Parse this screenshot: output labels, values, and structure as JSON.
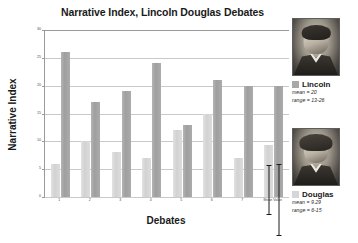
{
  "chart_data": {
    "type": "bar",
    "title": "Narrative Index, Lincoln Douglas Debates",
    "xlabel": "Debates",
    "ylabel": "Narrative Index",
    "ylim": [
      0,
      30
    ],
    "yticks": [
      0,
      5,
      10,
      15,
      20,
      25,
      30
    ],
    "ytick_labels": [
      "0",
      "5",
      "10",
      "15",
      "20",
      "25",
      "30"
    ],
    "grid": true,
    "legend_position": "right",
    "categories": [
      "1",
      "2",
      "3",
      "4",
      "5",
      "6",
      "7",
      "Mean Value"
    ],
    "series": [
      {
        "name": "Douglas",
        "color": "#d6d6d6",
        "values": [
          6,
          10,
          8,
          7,
          12,
          15,
          7,
          9.29
        ]
      },
      {
        "name": "Lincoln",
        "color": "#a8a8a8",
        "values": [
          26,
          17,
          19,
          24,
          13,
          21,
          20,
          20
        ]
      }
    ],
    "error_bars": [
      {
        "series": "Douglas",
        "category": "Mean Value",
        "low": 6,
        "high": 15
      },
      {
        "series": "Lincoln",
        "category": "Mean Value",
        "low": 13,
        "high": 26
      }
    ]
  },
  "legend": {
    "lincoln": {
      "name": "Lincoln",
      "mean": "mean = 20",
      "range": "range = 13-26",
      "portrait_caption": "Lincoln"
    },
    "douglas": {
      "name": "Douglas",
      "mean": "mean = 9.29",
      "range": "range = 6-15",
      "portrait_caption": "Douglas"
    }
  }
}
